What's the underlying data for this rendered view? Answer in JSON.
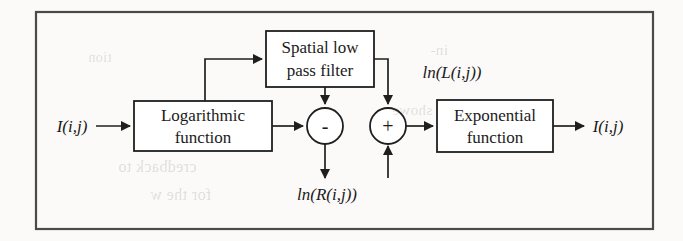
{
  "figure": {
    "type": "block-diagram",
    "background_color": "#fbfaf8",
    "line_color": "#1f1f1f",
    "frame_color": "#4a4a4a"
  },
  "frame": {
    "x": 36,
    "y": 12,
    "width": 617,
    "height": 217
  },
  "blocks": [
    {
      "id": "spatial-filter",
      "line1": "Spatial low",
      "line2": "pass filter",
      "x": 266,
      "y": 31,
      "width": 108,
      "height": 56
    },
    {
      "id": "logarithmic",
      "line1": "Logarithmic",
      "line2": "function",
      "x": 134,
      "y": 101,
      "width": 138,
      "height": 50
    },
    {
      "id": "exponential",
      "line1": "Exponential",
      "line2": "function",
      "x": 437,
      "y": 100,
      "width": 116,
      "height": 52
    }
  ],
  "operators": [
    {
      "id": "subtract",
      "symbol": "-",
      "cx": 325,
      "cy": 126,
      "r": 18
    },
    {
      "id": "add",
      "symbol": "+",
      "cx": 388,
      "cy": 126,
      "r": 18
    }
  ],
  "signals": {
    "input": "I(i,j)",
    "output": "I(i,j)",
    "illumination": "ln(L(i,j))",
    "reflectance": "ln(R(i,j))"
  },
  "labels": {
    "input_x": 72,
    "input_y": 131,
    "output_x": 605,
    "output_y": 131,
    "illumination_x": 452,
    "illumination_y": 76,
    "reflectance_x": 325,
    "reflectance_y": 199
  },
  "ghost_text": [
    {
      "text": "credback to",
      "x": 118,
      "y": 168,
      "size": 16
    },
    {
      "text": "for the w",
      "x": 150,
      "y": 196,
      "size": 16
    },
    {
      "text": "in-",
      "x": 430,
      "y": 52,
      "size": 15
    },
    {
      "text": "showe",
      "x": 392,
      "y": 112,
      "size": 15
    },
    {
      "text": "tion",
      "x": 88,
      "y": 60,
      "size": 14
    }
  ]
}
